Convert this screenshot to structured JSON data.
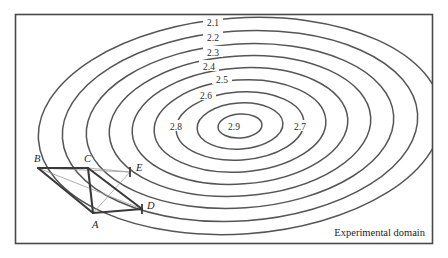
{
  "figure": {
    "domain_label": "Experimental domain",
    "border_color": "#4a4a4a",
    "contour_color": "#555555",
    "simplex_color": "#3a3a3a",
    "faint_line_color": "#9a9a9a",
    "background": "#ffffff"
  },
  "chart_data": {
    "type": "line",
    "title": "",
    "subtitle": "",
    "xlabel": "",
    "ylabel": "",
    "grid": false,
    "legend": "none",
    "plot_kind": "contour-response-surface-with-simplex",
    "annotations": [
      {
        "name": "domain-annotation",
        "text": "Experimental domain"
      }
    ],
    "contours": [
      {
        "level": "2.1",
        "label": "2.1",
        "rank": 1,
        "cx": 240,
        "cy": 126,
        "rx": 202,
        "ry": 108,
        "rotation": -4
      },
      {
        "level": "2.2",
        "label": "2.2",
        "rank": 2,
        "cx": 240,
        "cy": 126,
        "rx": 178,
        "ry": 95,
        "rotation": -4
      },
      {
        "level": "2.3",
        "label": "2.3",
        "rank": 3,
        "cx": 240,
        "cy": 126,
        "rx": 154,
        "ry": 82,
        "rotation": -4
      },
      {
        "level": "2.4",
        "label": "2.4",
        "rank": 4,
        "cx": 240,
        "cy": 126,
        "rx": 131,
        "ry": 70,
        "rotation": -4
      },
      {
        "level": "2.5",
        "label": "2.5",
        "rank": 5,
        "cx": 240,
        "cy": 126,
        "rx": 108,
        "ry": 58,
        "rotation": -4
      },
      {
        "level": "2.6",
        "label": "2.6",
        "rank": 6,
        "cx": 240,
        "cy": 126,
        "rx": 86,
        "ry": 46,
        "rotation": -4
      },
      {
        "level": "2.7",
        "label": "2.7",
        "rank": 7,
        "cx": 240,
        "cy": 126,
        "rx": 64,
        "ry": 34,
        "rotation": -4
      },
      {
        "level": "2.8",
        "label": "2.8",
        "rank": 8,
        "cx": 240,
        "cy": 126,
        "rx": 43,
        "ry": 23,
        "rotation": -4
      },
      {
        "level": "2.9",
        "label": "2.9",
        "rank": 9,
        "cx": 240,
        "cy": 126,
        "rx": 22,
        "ry": 12,
        "rotation": -4
      }
    ],
    "contour_label_positions": [
      {
        "label": "2.1",
        "x": 213,
        "y": 22
      },
      {
        "label": "2.2",
        "x": 213,
        "y": 37
      },
      {
        "label": "2.3",
        "x": 213,
        "y": 52
      },
      {
        "label": "2.4",
        "x": 209,
        "y": 66
      },
      {
        "label": "2.5",
        "x": 222,
        "y": 79
      },
      {
        "label": "2.6",
        "x": 206,
        "y": 95
      },
      {
        "label": "2.7",
        "x": 300,
        "y": 126
      },
      {
        "label": "2.8",
        "x": 176,
        "y": 126
      },
      {
        "label": "2.9",
        "x": 234,
        "y": 126
      }
    ],
    "simplex_points": [
      {
        "name": "A",
        "label": "A",
        "x": 93,
        "y": 213,
        "label_x": 92,
        "label_y": 228
      },
      {
        "name": "B",
        "label": "B",
        "x": 38,
        "y": 168,
        "label_x": 34,
        "label_y": 162
      },
      {
        "name": "C",
        "label": "C",
        "x": 88,
        "y": 168,
        "label_x": 84,
        "label_y": 162
      },
      {
        "name": "D",
        "label": "D",
        "x": 142,
        "y": 209,
        "label_x": 147,
        "label_y": 209
      },
      {
        "name": "E",
        "label": "E",
        "x": 130,
        "y": 172,
        "label_x": 136,
        "label_y": 171
      }
    ],
    "simplex_edges": [
      {
        "from": "B",
        "to": "C",
        "style": "solid"
      },
      {
        "from": "B",
        "to": "A",
        "style": "solid"
      },
      {
        "from": "C",
        "to": "A",
        "style": "solid"
      },
      {
        "from": "A",
        "to": "D",
        "style": "solid"
      },
      {
        "from": "C",
        "to": "D",
        "style": "solid"
      },
      {
        "from": "B",
        "to": "D",
        "style": "faint"
      },
      {
        "from": "C",
        "to": "E",
        "style": "faint"
      },
      {
        "from": "A",
        "to": "E",
        "style": "faint"
      },
      {
        "from": "B",
        "to": "E",
        "style": "faint"
      }
    ]
  }
}
